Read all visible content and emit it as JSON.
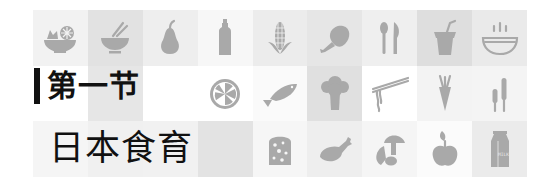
{
  "section": {
    "label": "第一节"
  },
  "chapter": {
    "title": "日本食育"
  },
  "colors": {
    "icon": "#a9a9a9",
    "text": "#111111",
    "bar": "#111111"
  },
  "grid": {
    "rows": 3,
    "cols": 9,
    "tiles": [
      [
        {
          "icon": "salad-bowl-icon",
          "bg": "#f2f2f2"
        },
        {
          "icon": "rice-bowl-chopsticks-icon",
          "bg": "#e2e2e2"
        },
        {
          "icon": "pear-icon",
          "bg": "#eeeeee"
        },
        {
          "icon": "bottle-icon",
          "bg": "#f7f7f7"
        },
        {
          "icon": "corn-icon",
          "bg": "#ececec"
        },
        {
          "icon": "roast-chicken-icon",
          "bg": "#e6e6e6"
        },
        {
          "icon": "spoon-knife-icon",
          "bg": "#efefef"
        },
        {
          "icon": "drink-cup-straw-icon",
          "bg": "#dedede"
        },
        {
          "icon": "steaming-bowl-icon",
          "bg": "#eaeaea"
        }
      ],
      [
        {
          "icon": "",
          "bg": "#ffffff"
        },
        {
          "icon": "",
          "bg": "#e6e6e6"
        },
        {
          "icon": "",
          "bg": "#ffffff"
        },
        {
          "icon": "lemon-slice-icon",
          "bg": "#ffffff"
        },
        {
          "icon": "fish-icon",
          "bg": "#fafafa"
        },
        {
          "icon": "broccoli-icon",
          "bg": "#e0e0e0"
        },
        {
          "icon": "noodles-chopsticks-icon",
          "bg": "#ffffff"
        },
        {
          "icon": "carrot-icon",
          "bg": "#f3f3f3"
        },
        {
          "icon": "wheat-icon",
          "bg": "#f4f4f4"
        }
      ],
      [
        {
          "icon": "",
          "bg": "#f5f5f5"
        },
        {
          "icon": "",
          "bg": "#f0f0f0"
        },
        {
          "icon": "",
          "bg": "#f1f1f1"
        },
        {
          "icon": "",
          "bg": "#e3e3e3"
        },
        {
          "icon": "bread-slice-icon",
          "bg": "#f6f6f6"
        },
        {
          "icon": "chicken-leg-icon",
          "bg": "#eeeeee"
        },
        {
          "icon": "mushrooms-icon",
          "bg": "#f5f5f5"
        },
        {
          "icon": "apple-icon",
          "bg": "#fbfbfb"
        },
        {
          "icon": "milk-carton-icon",
          "bg": "#ebebeb"
        }
      ]
    ],
    "milk_label": "MILK"
  }
}
